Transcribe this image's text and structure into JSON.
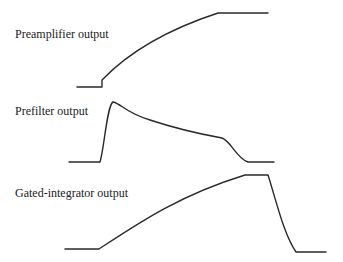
{
  "diagram": {
    "panels": [
      {
        "label": "Preamplifier output",
        "label_pos": {
          "x": 15,
          "y": 28
        },
        "path": "M77,87 L102,87 L102,80 C125,56 160,32 218,13 L268,13"
      },
      {
        "label": "Prefilter output",
        "label_pos": {
          "x": 15,
          "y": 105
        },
        "path": "M69,162 L100,162 C104,150 107,105 113,102 C122,104 124,112 150,120 C180,130 200,134 222,138 C232,142 236,158 248,162 L274,162"
      },
      {
        "label": "Gated-integrator output",
        "label_pos": {
          "x": 15,
          "y": 187
        },
        "path": "M65,249 L99,249 C140,222 180,195 245,175 L268,175 C276,200 284,235 296,252 L326,252"
      }
    ],
    "stroke_color": "#2a2a2a",
    "text_color": "#222222"
  }
}
